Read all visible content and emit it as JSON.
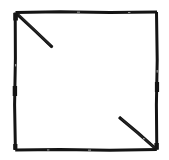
{
  "figure": {
    "title": "Square with two corner diagonal segments",
    "style": "hand-drawn scanned line art",
    "colors": {
      "background": "#ffffff",
      "ink": "#141414",
      "ink_light": "#3a3a3a"
    },
    "canvas": {
      "width": 169,
      "height": 160
    },
    "square": {
      "name": "outer-square",
      "left": 15,
      "top": 12,
      "right": 157,
      "bottom": 150,
      "width": 142,
      "height": 138,
      "stroke_width": 3
    },
    "segments": [
      {
        "name": "top-left-diagonal",
        "x1": 16,
        "y1": 13,
        "x2": 52,
        "y2": 47,
        "stroke_width": 3,
        "direction": "northwest-to-southeast",
        "anchor_corner": "top-left"
      },
      {
        "name": "bottom-right-diagonal",
        "x1": 119,
        "y1": 117,
        "x2": 156,
        "y2": 149,
        "stroke_width": 3,
        "direction": "northwest-to-southeast",
        "anchor_corner": "bottom-right"
      }
    ]
  }
}
